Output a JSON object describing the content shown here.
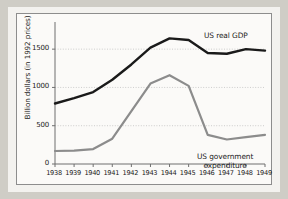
{
  "figure": {
    "background_color": "#f3f2ef",
    "page_background_color": "#cfcdc6",
    "border_color": "#8d8d8d"
  },
  "axis": {
    "ylabel": "Billion dollars (in 1992 prices)",
    "yticks": [
      "0",
      "500",
      "1000",
      "1500"
    ],
    "xticks": [
      "1938",
      "1939",
      "1940",
      "1941",
      "1942",
      "1943",
      "1944",
      "1945",
      "1946",
      "1947",
      "1948",
      "1949"
    ]
  },
  "labels": {
    "gdp": "US real GDP",
    "gov_line1": "US government",
    "gov_line2": "expenditure"
  },
  "chart_data": {
    "type": "line",
    "title": "",
    "xlabel": "",
    "ylabel": "Billion dollars (in 1992 prices)",
    "x": [
      1938,
      1939,
      1940,
      1941,
      1942,
      1943,
      1944,
      1945,
      1946,
      1947,
      1948,
      1949
    ],
    "categories": [
      "1938",
      "1939",
      "1940",
      "1941",
      "1942",
      "1943",
      "1944",
      "1945",
      "1946",
      "1947",
      "1948",
      "1949"
    ],
    "ylim": [
      0,
      1750
    ],
    "yticks": [
      0,
      500,
      1000,
      1500
    ],
    "grid": true,
    "grid_style": "dotted-horizontal",
    "legend": "inline-annotations",
    "series": [
      {
        "name": "US real GDP",
        "color": "#1a1a1a",
        "line_width": 2.4,
        "values": [
          790,
          860,
          940,
          1100,
          1300,
          1520,
          1640,
          1620,
          1450,
          1440,
          1500,
          1480
        ]
      },
      {
        "name": "US government expenditure",
        "color": "#8c8c8c",
        "line_width": 2.2,
        "values": [
          170,
          175,
          195,
          330,
          690,
          1050,
          1160,
          1020,
          380,
          320,
          350,
          380
        ]
      }
    ]
  }
}
